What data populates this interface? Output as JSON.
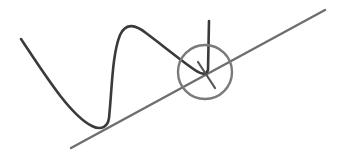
{
  "diagram": {
    "colors": {
      "background": "#ffffff",
      "curve": "#3a3a3a",
      "tangent_line": "#6e6e6e",
      "circle": "#7a7a7a",
      "normal_tick": "#555555"
    },
    "curve": {
      "path": "M21,39 C45,75 70,115 92,126 C102,131 108,126 109,118 C112,90 112,55 120,35 C126,22 136,25 146,33 C162,45 178,58 192,68 C200,74 206,76 208,70 L209,21"
    },
    "tangent_line": {
      "x1": 71,
      "y1": 148,
      "x2": 325,
      "y2": 10
    },
    "circle": {
      "cx": 205,
      "cy": 72,
      "r": 27
    },
    "normal_tick": {
      "x1": 198,
      "y1": 62,
      "x2": 215,
      "y2": 88
    }
  }
}
